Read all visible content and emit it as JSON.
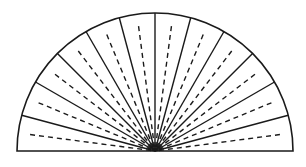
{
  "diagram": {
    "title": "",
    "shape": "semicircle",
    "center": [
      155,
      151
    ],
    "radius": 138,
    "sector_count": 12,
    "sector_angle_deg": 15,
    "solid_line_angles_deg": [
      0,
      15,
      30,
      45,
      60,
      75,
      90,
      105,
      120,
      135,
      150,
      165,
      180
    ],
    "dashed_line_angles_deg": [
      7.5,
      22.5,
      37.5,
      52.5,
      67.5,
      82.5,
      97.5,
      112.5,
      127.5,
      142.5,
      157.5,
      172.5
    ],
    "dashed_inner_radius": 4,
    "dashed_outer_radius": 128,
    "stroke_color": "#1a1a1a",
    "background_color": "#ffffff"
  }
}
